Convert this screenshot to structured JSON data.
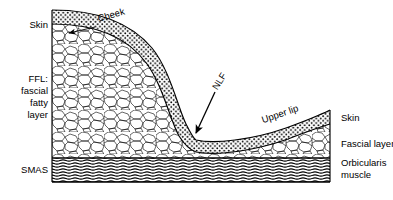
{
  "figure": {
    "type": "anatomical-cross-section",
    "background_color": "#ffffff",
    "line_color": "#000000"
  },
  "labels_left": [
    {
      "name": "skin",
      "lines": [
        "Skin"
      ],
      "x": 48,
      "y": 28
    },
    {
      "name": "ffl",
      "lines": [
        "FFL:",
        "fascial",
        "fatty",
        "layer"
      ],
      "x": 48,
      "y": 82
    },
    {
      "name": "smas",
      "lines": [
        "SMAS"
      ],
      "x": 48,
      "y": 173
    }
  ],
  "labels_right": [
    {
      "name": "skin",
      "lines": [
        "Skin"
      ],
      "x": 341,
      "y": 121
    },
    {
      "name": "fascial-layer",
      "lines": [
        "Fascial layer"
      ],
      "x": 341,
      "y": 147
    },
    {
      "name": "orbicularis-muscle",
      "lines": [
        "Orbicularis",
        "muscle"
      ],
      "x": 341,
      "y": 166
    }
  ],
  "labels_inline": [
    {
      "name": "cheek",
      "text": "Cheek",
      "x": 112,
      "y": 18,
      "rotate": -16
    },
    {
      "name": "nlf",
      "text": "NLF",
      "x": 222,
      "y": 83,
      "rotate": -58
    },
    {
      "name": "upper-lip",
      "text": "Upper lip",
      "x": 281,
      "y": 117,
      "rotate": -19
    }
  ],
  "annotations": [
    {
      "name": "nlf-arrow",
      "from_x": 215,
      "from_y": 92,
      "to_x": 196,
      "to_y": 133
    },
    {
      "name": "skin-tick-arrow",
      "from_x": 95,
      "from_y": 27,
      "to_x": 69,
      "to_y": 33
    }
  ],
  "layers": [
    {
      "name": "skin",
      "texture": "stipple-dots",
      "label": "Skin"
    },
    {
      "name": "fascial-fatty-layer",
      "texture": "polygonal-cells",
      "label": "FFL: fascial fatty layer"
    },
    {
      "name": "fascial-layer",
      "texture": "polygonal-cells",
      "label": "Fascial layer"
    },
    {
      "name": "smas-orbicularis",
      "texture": "wavy-horizontal-hatch",
      "label": "SMAS / Orbicularis muscle"
    }
  ],
  "geometry": {
    "left_border_x": 52,
    "right_border_x": 330,
    "top_y": 10,
    "smas_top_y": 158,
    "smas_bottom_y": 182,
    "fold_valley_x": 196,
    "fold_valley_y": 140
  }
}
